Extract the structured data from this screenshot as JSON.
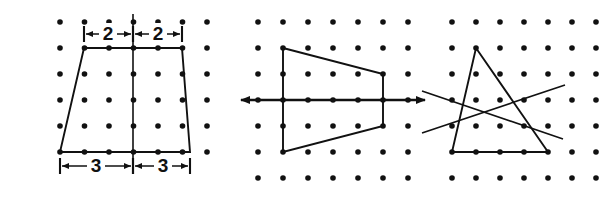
{
  "figure": {
    "background_color": "#ffffff",
    "ink_color": "#111111",
    "width": 605,
    "height": 201,
    "panels": [
      {
        "id": "panel-left",
        "name": "trapezoid-with-dimensions",
        "grid": {
          "columns": 7,
          "rows": 6,
          "origin_x": 60,
          "origin_y": 22,
          "spacing_x": 24.5,
          "spacing_y": 26,
          "dot_radius": 2.8
        },
        "shape": {
          "type": "trapezoid",
          "vertices": [
            [
              84,
              48
            ],
            [
              182,
              48
            ],
            [
              190,
              152
            ],
            [
              60,
              152
            ]
          ]
        },
        "center_line": {
          "x": 133,
          "y1": 14,
          "y2": 166
        },
        "dimensions": [
          {
            "label": "2",
            "side": "top",
            "from_x": 84,
            "to_x": 133,
            "y": 34,
            "text_x": 108
          },
          {
            "label": "2",
            "side": "top",
            "from_x": 133,
            "to_x": 182,
            "y": 34,
            "text_x": 158
          },
          {
            "label": "3",
            "side": "bottom",
            "from_x": 60,
            "to_x": 133,
            "y": 166,
            "text_x": 96
          },
          {
            "label": "3",
            "side": "bottom",
            "from_x": 133,
            "to_x": 190,
            "y": 166,
            "text_x": 163
          }
        ]
      },
      {
        "id": "panel-middle",
        "name": "trapezoid-on-horizontal-axis",
        "grid": {
          "columns": 7,
          "rows": 7,
          "origin_x": 258,
          "origin_y": 22,
          "spacing_x": 25,
          "spacing_y": 26,
          "dot_radius": 2.8
        },
        "shape": {
          "type": "quadrilateral",
          "vertices": [
            [
              283,
              48
            ],
            [
              383,
              74
            ],
            [
              383,
              126
            ],
            [
              283,
              152
            ]
          ]
        },
        "axis": {
          "name": "horizontal-double-arrow",
          "y": 100,
          "x1": 241,
          "x2": 425,
          "arrowheads": "both"
        }
      },
      {
        "id": "panel-right",
        "name": "triangle-with-two-crossing-lines",
        "grid": {
          "columns": 7,
          "rows": 7,
          "origin_x": 452,
          "origin_y": 22,
          "spacing_x": 24,
          "spacing_y": 26,
          "dot_radius": 2.8
        },
        "shape": {
          "type": "triangle",
          "vertices": [
            [
              476,
              48
            ],
            [
              548,
              152
            ],
            [
              452,
              152
            ]
          ]
        },
        "crossing_lines": [
          {
            "name": "line-up-right",
            "x1": 422,
            "y1": 133,
            "x2": 565,
            "y2": 85
          },
          {
            "name": "line-down-right",
            "x1": 422,
            "y1": 91,
            "x2": 563,
            "y2": 139
          }
        ]
      }
    ]
  }
}
